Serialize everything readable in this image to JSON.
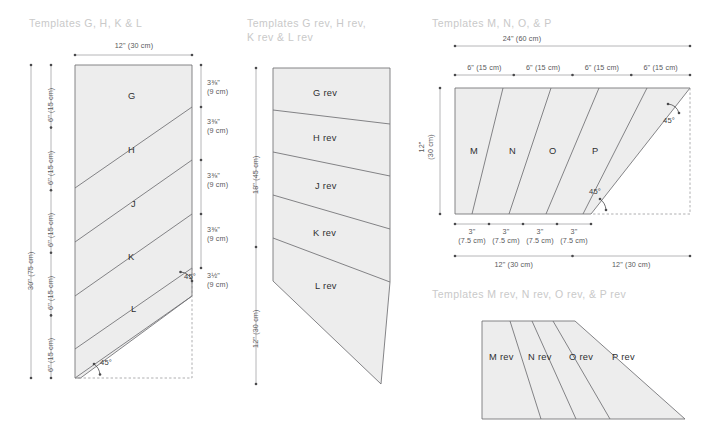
{
  "document": {
    "kind": "quilting-template-cutting-diagram",
    "ink": "#6f6f72",
    "fill": "#ededed",
    "title_color": "#c9c9c9",
    "label_color": "#2f2f31"
  },
  "panels": [
    {
      "id": "panel-1",
      "title": "Templates G, H, K & L",
      "pieces": [
        "G",
        "H",
        "J",
        "K",
        "L"
      ],
      "top_dim": "12\" (30 cm)",
      "left_outer_dim": "30\" (75 cm)",
      "left_inner_dims": [
        "6\" (15 cm)",
        "6\" (15 cm)",
        "6\" (15 cm)",
        "6\" (15 cm)",
        "6\" (15 cm)"
      ],
      "right_dims": [
        "3⅜\"\n(9 cm)",
        "3⅜\"\n(9 cm)",
        "3⅜\"\n(9 cm)",
        "3⅜\"\n(9 cm)",
        "3½\"\n(9 cm)"
      ],
      "angles": [
        "45°",
        "45°"
      ]
    },
    {
      "id": "panel-2",
      "title": "Templates G rev, H rev,\nK rev & L rev",
      "pieces": [
        "G rev",
        "H rev",
        "J rev",
        "K rev",
        "L rev"
      ],
      "left_dims": [
        "18\" (45 cm)",
        "12\" (30 cm)"
      ]
    },
    {
      "id": "panel-3",
      "title": "Templates  M, N, O, & P",
      "pieces": [
        "M",
        "N",
        "O",
        "P"
      ],
      "top_dim": "24\" (60 cm)",
      "top_segments": [
        "6\" (15 cm)",
        "6\" (15 cm)",
        "6\" (15 cm)",
        "6\" (15 cm)"
      ],
      "left_dim": "12\"\n(30 cm)",
      "bottom_segments": [
        "3\"\n(7.5 cm)",
        "3\"\n(7.5 cm)",
        "3\"\n(7.5 cm)",
        "3\"\n(7.5 cm)"
      ],
      "bottom_dims": [
        "12\" (30 cm)",
        "12\" (30 cm)"
      ],
      "angles": [
        "45°",
        "45°"
      ]
    },
    {
      "id": "panel-4",
      "title": "Templates  M rev, N rev, O rev, & P rev",
      "pieces": [
        "M rev",
        "N rev",
        "O rev",
        "P rev"
      ]
    }
  ]
}
